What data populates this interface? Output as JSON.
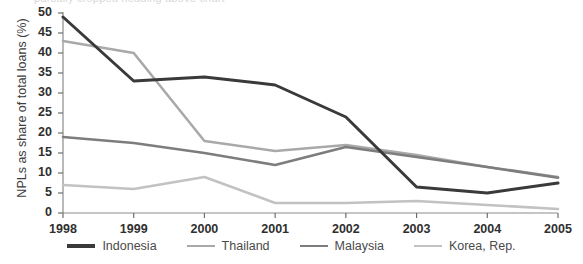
{
  "chart_data": {
    "type": "line",
    "title": "",
    "xlabel": "",
    "ylabel": "NPLs as share of total loans (%)",
    "x": [
      1998,
      1999,
      2000,
      2001,
      2002,
      2003,
      2004,
      2005
    ],
    "xtick_labels": [
      "1998",
      "1999",
      "2000",
      "2001",
      "2002",
      "2003",
      "2004",
      "2005"
    ],
    "ytick_labels": [
      "0",
      "5",
      "10",
      "15",
      "20",
      "25",
      "30",
      "35",
      "40",
      "45",
      "50"
    ],
    "yticks": [
      0,
      5,
      10,
      15,
      20,
      25,
      30,
      35,
      40,
      45,
      50
    ],
    "ylim": [
      0,
      50
    ],
    "xlim": [
      1998,
      2005
    ],
    "grid": false,
    "legend_position": "bottom",
    "series": [
      {
        "name": "Indonesia",
        "color": "#3a3a3a",
        "width": 3.0,
        "values": [
          49,
          33,
          34,
          32,
          24,
          6.5,
          5,
          7.5
        ]
      },
      {
        "name": "Thailand",
        "color": "#a9a9a9",
        "width": 2.6,
        "values": [
          43,
          40,
          18,
          15.5,
          17,
          14.5,
          11.5,
          9
        ]
      },
      {
        "name": "Malaysia",
        "color": "#7d7d7d",
        "width": 2.6,
        "values": [
          19,
          17.5,
          15,
          12,
          16.5,
          14,
          11.5,
          8.8
        ]
      },
      {
        "name": "Korea, Rep.",
        "color": "#c2c2c2",
        "width": 2.6,
        "values": [
          7,
          6,
          9,
          2.5,
          2.5,
          3,
          2,
          1
        ]
      }
    ]
  },
  "axis": {
    "title_text": "NPLs as share of total loans (%)",
    "tick_color": "#6e6e6e",
    "axis_color": "#8c8c8c"
  },
  "top_clip": {
    "text": "partially cropped heading above chart"
  },
  "legend": {
    "items": [
      {
        "label": "Indonesia",
        "color": "#3a3a3a"
      },
      {
        "label": "Thailand",
        "color": "#a9a9a9"
      },
      {
        "label": "Malaysia",
        "color": "#7d7d7d"
      },
      {
        "label": "Korea, Rep.",
        "color": "#c2c2c2"
      }
    ]
  }
}
